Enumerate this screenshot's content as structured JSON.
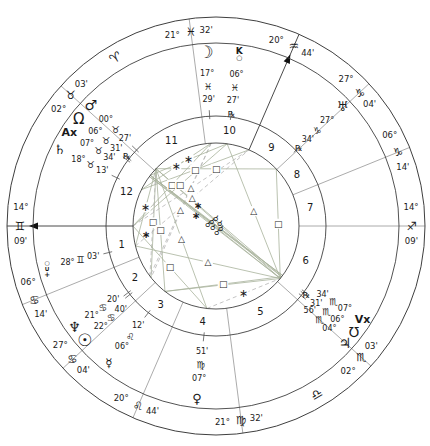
{
  "chart": {
    "width": 430,
    "height": 446,
    "center": {
      "x": 216,
      "y": 226
    },
    "radii": {
      "outer": 209,
      "zodiac_inner": 183,
      "house_outer": 110,
      "aspect": 83,
      "house_number": 96,
      "cusp_label": 196,
      "planet_label_radii": [
        174,
        153,
        139.5,
        126.5,
        113.5
      ]
    },
    "colors": {
      "background": "#ffffff",
      "ring": "#3f3f3f",
      "cusp_line": "#8f8f8f",
      "axis_line": "#4a4a4a",
      "arrow": "#111111",
      "tick": "#555555",
      "aspect_solid": "#a8b29c",
      "aspect_dashed": "#b5b5b5",
      "text": "#1a1a1a"
    },
    "ascendant_longitude": 74.15,
    "standalone_signs": [
      {
        "name": "aries",
        "glyph": "♈",
        "longitude": 15
      },
      {
        "name": "libra",
        "glyph": "♎",
        "longitude": 195
      }
    ],
    "houses": [
      {
        "num": "1",
        "longitude": 74.15,
        "deg": "14°",
        "sign_glyph": "♊",
        "min": "09'",
        "arrow": true
      },
      {
        "num": "2",
        "longitude": 96.233,
        "deg": "06°",
        "sign_glyph": "♋",
        "min": "14'"
      },
      {
        "num": "3",
        "longitude": 117.067,
        "deg": "27°",
        "sign_glyph": "♋",
        "min": "04'"
      },
      {
        "num": "4",
        "longitude": 140.733,
        "deg": "20°",
        "sign_glyph": "♌",
        "min": "44'"
      },
      {
        "num": "5",
        "longitude": 171.533,
        "deg": "21°",
        "sign_glyph": "♍",
        "min": "32'"
      },
      {
        "num": "6",
        "longitude": 212.05,
        "deg": "02°",
        "sign_glyph": "♏",
        "min": "03'"
      },
      {
        "num": "7",
        "longitude": 254.15,
        "deg": "14°",
        "sign_glyph": "♐",
        "min": "09'"
      },
      {
        "num": "8",
        "longitude": 276.233,
        "deg": "06°",
        "sign_glyph": "♑",
        "min": "14'"
      },
      {
        "num": "9",
        "longitude": 297.067,
        "deg": "27°",
        "sign_glyph": "♑",
        "min": "04'"
      },
      {
        "num": "10",
        "longitude": 320.733,
        "deg": "20°",
        "sign_glyph": "♒",
        "min": "44'",
        "arrow": true
      },
      {
        "num": "11",
        "longitude": 351.533,
        "deg": "21°",
        "sign_glyph": "♓",
        "min": "32'"
      },
      {
        "num": "12",
        "longitude": 32.05,
        "deg": "02°",
        "sign_glyph": "♉",
        "min": "03'"
      }
    ],
    "retro_glyph": "℞",
    "planets": [
      {
        "name": "moon",
        "glyph": "☽",
        "glyph_size": 17,
        "deg": "17°",
        "sign": "♓",
        "min": "29'",
        "retro": false,
        "longitude": 347.483,
        "display_longitude": 347.48
      },
      {
        "name": "chiron",
        "composite": [
          {
            "t": "K",
            "dy": -3,
            "size": 9
          },
          {
            "t": "○",
            "dy": 4,
            "size": 7
          }
        ],
        "deg": "06°",
        "sign": "♓",
        "min": "27'",
        "retro": true,
        "longitude": 336.45,
        "display_longitude": 336.45
      },
      {
        "name": "mars",
        "glyph": "♂",
        "glyph_size": 14,
        "deg": "00°",
        "sign": "♉",
        "min": "27'",
        "retro": false,
        "longitude": 30.45,
        "display_longitude": 30.2
      },
      {
        "name": "north-node",
        "glyph": "Ω",
        "glyph_size": 15,
        "deg": "06°",
        "sign": "♉",
        "min": "31'",
        "retro": true,
        "longitude": 36.517,
        "display_longitude": 36.2
      },
      {
        "name": "anti-vertex",
        "glyph": "Ax",
        "glyph_size": 11,
        "deg": "07°",
        "sign": "♉",
        "min": "34'",
        "retro": false,
        "longitude": 37.567,
        "display_longitude": 41.6
      },
      {
        "name": "saturn",
        "glyph": "♄",
        "glyph_size": 13,
        "deg": "18°",
        "sign": "♉",
        "min": "13'",
        "retro": false,
        "longitude": 48.217,
        "display_longitude": 48.2
      },
      {
        "name": "pluto",
        "composite": [
          {
            "t": "○",
            "dy": -5,
            "size": 6
          },
          {
            "t": "∪",
            "dy": 1,
            "size": 7
          },
          {
            "t": "+",
            "dy": 7,
            "size": 7
          }
        ],
        "deg": "28°",
        "sign": "♊",
        "min": "03'",
        "retro": false,
        "longitude": 88.05,
        "display_longitude": 88.05
      },
      {
        "name": "neptune",
        "glyph": "♆",
        "glyph_size": 14,
        "deg": "21°",
        "sign": "♋",
        "min": "20'",
        "retro": false,
        "longitude": 111.333,
        "display_longitude": 109.8
      },
      {
        "name": "sun",
        "glyph": "☉",
        "glyph_size": 17,
        "deg": "22°",
        "sign": "♋",
        "min": "40'",
        "retro": false,
        "longitude": 112.667,
        "display_longitude": 115.3
      },
      {
        "name": "mercury",
        "glyph": "☿",
        "glyph_size": 12,
        "deg": "06°",
        "sign": "♌",
        "min": "12'",
        "retro": false,
        "longitude": 126.2,
        "display_longitude": 126.2
      },
      {
        "name": "venus",
        "glyph": "♀",
        "glyph_size": 13,
        "deg": "07°",
        "sign": "♍",
        "min": "51'",
        "retro": false,
        "longitude": 157.85,
        "display_longitude": 157.85
      },
      {
        "name": "jupiter",
        "glyph": "♃",
        "glyph_size": 14,
        "deg": "04°",
        "sign": "♏",
        "min": "56'",
        "retro": false,
        "longitude": 214.933,
        "display_longitude": 212.0
      },
      {
        "name": "south-node",
        "glyph": "℧",
        "glyph_size": 14,
        "deg": "06°",
        "sign": "♏",
        "min": "31'",
        "retro": true,
        "longitude": 216.517,
        "display_longitude": 216.6
      },
      {
        "name": "vertex",
        "glyph": "Vx",
        "glyph_size": 11,
        "deg": "07°",
        "sign": "♏",
        "min": "34'",
        "retro": false,
        "longitude": 217.567,
        "display_longitude": 221.6
      },
      {
        "name": "uranus",
        "glyph": "♅",
        "glyph_size": 13,
        "deg": "27°",
        "sign": "♑",
        "min": "34'",
        "retro": true,
        "longitude": 297.567,
        "display_longitude": 297.57
      }
    ],
    "angle_points": [
      {
        "name": "asc",
        "longitude": 74.15
      },
      {
        "name": "mc",
        "longitude": 320.733
      }
    ],
    "aspect_glyphs": {
      "square": "□",
      "trine": "△",
      "sextile": "∗"
    },
    "aspects": [
      {
        "a": "uranus",
        "b": "mars",
        "type": "square",
        "dashed": false
      },
      {
        "a": "saturn",
        "b": "mc",
        "type": "square",
        "dashed": false
      },
      {
        "a": "moon",
        "b": "asc",
        "type": "square",
        "dashed": false
      },
      {
        "a": "chiron",
        "b": "asc",
        "type": "square",
        "dashed": false
      },
      {
        "a": "sun",
        "b": "mars",
        "type": "square",
        "dashed": false
      },
      {
        "a": "neptune",
        "b": "mars",
        "type": "square",
        "dashed": true
      },
      {
        "a": "mercury",
        "b": "mars",
        "type": "square",
        "dashed": false
      },
      {
        "a": "venus",
        "b": "asc",
        "type": "square",
        "dashed": false
      },
      {
        "a": "mercury",
        "b": "jupiter",
        "type": "square",
        "dashed": false
      },
      {
        "a": "mercury",
        "b": "south-node",
        "type": "square",
        "dashed": false
      },
      {
        "a": "uranus",
        "b": "jupiter",
        "type": "square",
        "dashed": false
      },
      {
        "a": "moon",
        "b": "sun",
        "type": "trine",
        "dashed": true
      },
      {
        "a": "moon",
        "b": "neptune",
        "type": "trine",
        "dashed": true
      },
      {
        "a": "venus",
        "b": "mars",
        "type": "trine",
        "dashed": false
      },
      {
        "a": "chiron",
        "b": "jupiter",
        "type": "trine",
        "dashed": false
      },
      {
        "a": "pluto",
        "b": "jupiter",
        "type": "trine",
        "dashed": false
      },
      {
        "a": "asc",
        "b": "mc",
        "type": "trine",
        "dashed": true
      },
      {
        "a": "pluto",
        "b": "mc",
        "type": "trine",
        "dashed": true
      },
      {
        "a": "moon",
        "b": "saturn",
        "type": "sextile",
        "dashed": false
      },
      {
        "a": "pluto",
        "b": "mars",
        "type": "sextile",
        "dashed": false
      },
      {
        "a": "venus",
        "b": "jupiter",
        "type": "sextile",
        "dashed": true
      },
      {
        "a": "chiron",
        "b": "north-node",
        "type": "sextile",
        "dashed": false
      },
      {
        "a": "north-node",
        "b": "south-node",
        "type": "opposition",
        "dashed": false
      },
      {
        "a": "anti-vertex",
        "b": "vertex",
        "type": "opposition",
        "dashed": false
      },
      {
        "a": "mars",
        "b": "jupiter",
        "type": "opposition",
        "dashed": false
      },
      {
        "a": "mars",
        "b": "south-node",
        "type": "opposition",
        "dashed": false
      },
      {
        "a": "north-node",
        "b": "jupiter",
        "type": "opposition",
        "dashed": false
      },
      {
        "a": "anti-vertex",
        "b": "jupiter",
        "type": "opposition",
        "dashed": false
      },
      {
        "a": "north-node",
        "b": "vertex",
        "type": "opposition",
        "dashed": false
      }
    ],
    "free_glyphs": [
      {
        "x": 198,
        "y": 205,
        "glyph": "∗",
        "size": 10,
        "bold": true
      },
      {
        "x": 196,
        "y": 215,
        "glyph": "∗",
        "size": 10,
        "bold": true
      },
      {
        "x": 146,
        "y": 234,
        "glyph": "∗",
        "size": 10,
        "bold": true
      },
      {
        "x": 212,
        "y": 221,
        "glyph": "☌",
        "size": 8,
        "bold": false
      },
      {
        "x": 216,
        "y": 218,
        "glyph": "☌",
        "size": 8,
        "bold": false
      },
      {
        "x": 220,
        "y": 223,
        "glyph": "☌",
        "size": 8,
        "bold": false
      },
      {
        "x": 213,
        "y": 227,
        "glyph": "☌",
        "size": 8,
        "bold": false
      },
      {
        "x": 221,
        "y": 228,
        "glyph": "☌",
        "size": 8,
        "bold": false
      },
      {
        "x": 217,
        "y": 232,
        "glyph": "☌",
        "size": 8,
        "bold": false
      },
      {
        "x": 208,
        "y": 224,
        "glyph": "☌",
        "size": 8,
        "bold": false
      }
    ]
  }
}
